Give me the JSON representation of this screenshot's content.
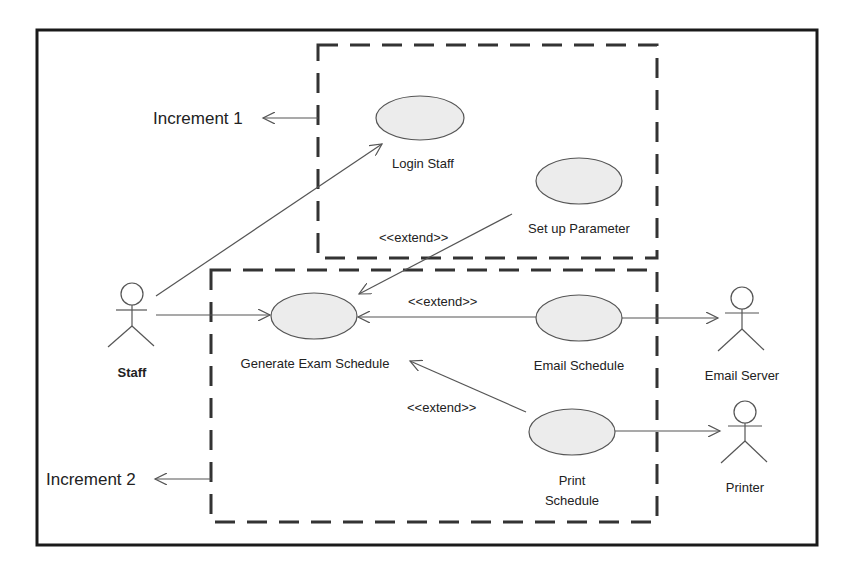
{
  "diagram": {
    "type": "UML use case diagram",
    "increments": [
      {
        "label": "Increment 1"
      },
      {
        "label": "Increment 2"
      }
    ],
    "actors": [
      {
        "id": "staff",
        "label": "Staff"
      },
      {
        "id": "email_server",
        "label": "Email Server"
      },
      {
        "id": "printer",
        "label": "Printer"
      }
    ],
    "use_cases": [
      {
        "id": "login_staff",
        "label": "Login Staff",
        "increment": 1
      },
      {
        "id": "setup_parameter",
        "label": "Set up Parameter",
        "increment": 1
      },
      {
        "id": "generate_exam_schedule",
        "label": "Generate Exam Schedule",
        "increment": 2
      },
      {
        "id": "email_schedule",
        "label": "Email Schedule",
        "increment": 2
      },
      {
        "id": "print_schedule",
        "label_line1": "Print",
        "label_line2": "Schedule",
        "increment": 2
      }
    ],
    "relationships": [
      {
        "from": "staff",
        "to": "login_staff",
        "type": "association"
      },
      {
        "from": "staff",
        "to": "generate_exam_schedule",
        "type": "association"
      },
      {
        "from": "setup_parameter",
        "to": "generate_exam_schedule",
        "type": "extend",
        "label": "<<extend>>"
      },
      {
        "from": "email_schedule",
        "to": "generate_exam_schedule",
        "type": "extend",
        "label": "<<extend>>"
      },
      {
        "from": "print_schedule",
        "to": "generate_exam_schedule",
        "type": "extend",
        "label": "<<extend>>"
      },
      {
        "from": "email_schedule",
        "to": "email_server",
        "type": "association"
      },
      {
        "from": "print_schedule",
        "to": "printer",
        "type": "association"
      }
    ],
    "colors": {
      "frame": "#1a1a1a",
      "dashed_boundary": "#333333",
      "ellipse_fill": "#ececec",
      "ellipse_stroke": "#555555",
      "line": "#555555"
    }
  }
}
